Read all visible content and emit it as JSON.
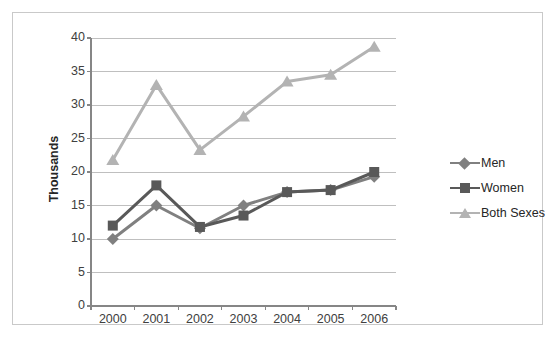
{
  "chart_data": {
    "type": "line",
    "title": "",
    "xlabel": "",
    "ylabel": "Thousands",
    "categories": [
      "2000",
      "2001",
      "2002",
      "2003",
      "2004",
      "2005",
      "2006"
    ],
    "x": [
      2000,
      2001,
      2002,
      2003,
      2004,
      2005,
      2006
    ],
    "ylim": [
      0,
      40
    ],
    "y_ticks": [
      0,
      5,
      10,
      15,
      20,
      25,
      30,
      35,
      40
    ],
    "y_tick_labels": [
      "0",
      "5",
      "10",
      "15",
      "20",
      "25",
      "30",
      "35",
      "40"
    ],
    "grid": true,
    "legend_position": "right",
    "series": [
      {
        "name": "Men",
        "marker": "diamond",
        "color": "#808080",
        "values": [
          10.0,
          15.0,
          11.6,
          15.0,
          17.0,
          17.3,
          19.3
        ]
      },
      {
        "name": "Women",
        "marker": "square",
        "color": "#595959",
        "values": [
          12.0,
          18.0,
          11.8,
          13.5,
          17.0,
          17.3,
          20.0
        ]
      },
      {
        "name": "Both Sexes",
        "marker": "triangle",
        "color": "#b3b3b3",
        "values": [
          21.8,
          33.0,
          23.3,
          28.3,
          33.5,
          34.5,
          38.7
        ]
      }
    ]
  },
  "style": {
    "axis_color": "#868686",
    "grid_color": "#bfbfbf",
    "frame_color": "#c9c9c9",
    "tick_text_color": "#404040",
    "title_text_color": "#262626",
    "plot_background": "#ffffff"
  },
  "legend": {
    "items": [
      {
        "label": "Men"
      },
      {
        "label": "Women"
      },
      {
        "label": "Both Sexes"
      }
    ]
  }
}
